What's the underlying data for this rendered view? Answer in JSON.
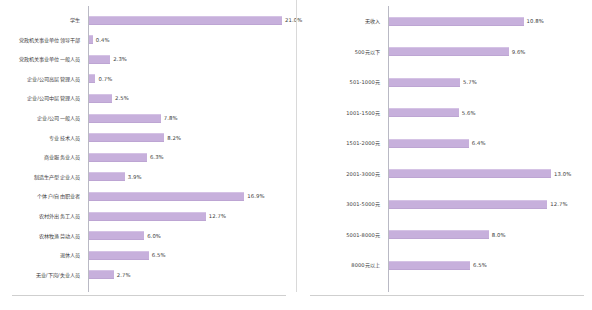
{
  "figure": {
    "bar_color": "#c7b0dc",
    "axis_color": "#b9b9c4",
    "text_color": "#3b3b3b",
    "background": "#ffffff"
  },
  "chart_data": [
    {
      "type": "bar",
      "orientation": "horizontal",
      "title": "",
      "xlabel": "",
      "ylabel": "",
      "xlim": [
        0,
        21.0
      ],
      "grid": false,
      "legend": "none",
      "categories": [
        "学生",
        "党政机关事业单位领导干部",
        "党政机关事业单位一般人员",
        "企业/公司高层管理人员",
        "企业/公司中层管理人员",
        "企业/公司一般人员",
        "专业技术人员",
        "商业服务业人员",
        "制造生产型企业人员",
        "个体户/自由职业者",
        "农村外出务工人员",
        "农林牧渔劳动人员",
        "退休人员",
        "无业/下岗/失业人员"
      ],
      "values": [
        21.0,
        0.4,
        2.3,
        0.7,
        2.5,
        7.8,
        8.2,
        6.3,
        3.9,
        16.9,
        12.7,
        6.0,
        6.5,
        2.7
      ],
      "value_labels": [
        "21.0%",
        "0.4%",
        "2.3%",
        "0.7%",
        "2.5%",
        "7.8%",
        "8.2%",
        "6.3%",
        "3.9%",
        "16.9%",
        "12.7%",
        "6.0%",
        "6.5%",
        "2.7%"
      ]
    },
    {
      "type": "bar",
      "orientation": "horizontal",
      "title": "",
      "xlabel": "",
      "ylabel": "",
      "xlim": [
        0,
        13.0
      ],
      "grid": false,
      "legend": "none",
      "categories": [
        "无收入",
        "500元以下",
        "501-1000元",
        "1001-1500元",
        "1501-2000元",
        "2001-3000元",
        "3001-5000元",
        "5001-8000元",
        "8000元以上"
      ],
      "values": [
        10.8,
        9.6,
        5.7,
        5.6,
        6.4,
        13.0,
        12.7,
        8.0,
        6.5
      ],
      "value_labels": [
        "10.8%",
        "9.6%",
        "5.7%",
        "5.6%",
        "6.4%",
        "13.0%",
        "12.7%",
        "8.0%",
        "6.5%"
      ]
    }
  ]
}
